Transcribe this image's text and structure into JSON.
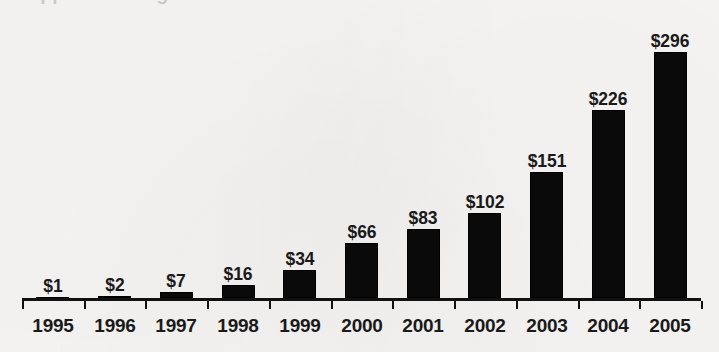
{
  "chart_data": {
    "type": "bar",
    "title": "",
    "xlabel": "",
    "ylabel": "",
    "categories": [
      "1995",
      "1996",
      "1997",
      "1998",
      "1999",
      "2000",
      "2001",
      "2002",
      "2003",
      "2004",
      "2005"
    ],
    "values": [
      1,
      2,
      7,
      16,
      34,
      66,
      83,
      102,
      151,
      226,
      296
    ],
    "value_labels": [
      "$1",
      "$2",
      "$7",
      "$16",
      "$34",
      "$66",
      "$83",
      "$102",
      "$151",
      "$226",
      "$296"
    ],
    "ylim": [
      0,
      296
    ],
    "grid": false,
    "legend": null,
    "axis": {
      "show_x_axis_line": true,
      "tick_count": 12,
      "y_axis_visible": false
    },
    "colors": {
      "bar": "#0a0a0a",
      "background": "#f6f5f3",
      "text": "#1a1a1a",
      "axis": "#111111"
    },
    "units": "dollars"
  },
  "title_remnant": "clipped heading above chart area"
}
